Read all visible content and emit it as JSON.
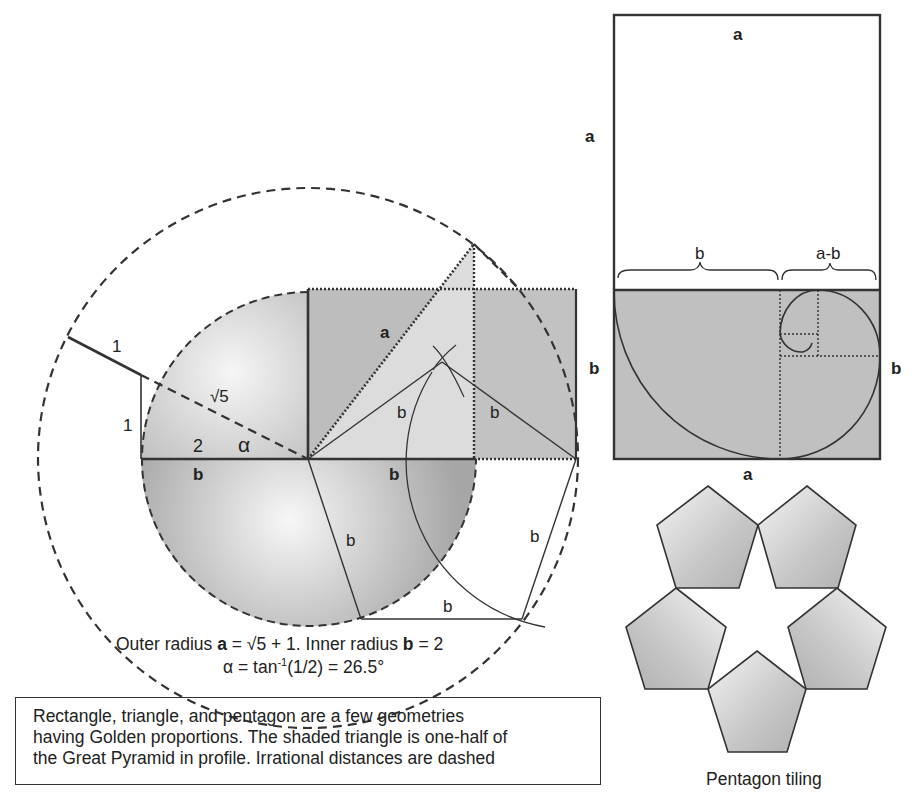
{
  "colors": {
    "line": "#333333",
    "shade_dark": "#a9a9a9",
    "shade_mid": "#c4c4c4",
    "shade_light": "#f2f2f2",
    "background": "#ffffff"
  },
  "circle_figure": {
    "labels": {
      "one_top": "1",
      "one_side": "1",
      "sqrt5": "√5",
      "two": "2",
      "alpha": "α",
      "b_left": "b",
      "b_right": "b",
      "a_diag": "a",
      "b_tri_left": "b",
      "b_tri_right": "b",
      "b_lower_left": "b",
      "b_lower_bottom": "b",
      "b_lower_right": "b",
      "b_rect_side": "b"
    },
    "formula_line1": {
      "prefix": "Outer radius ",
      "a": "a",
      "mid": " = √5 + 1. Inner radius ",
      "b": "b",
      "suffix": " = 2"
    },
    "formula_line2": {
      "prefix": "α = tan",
      "sup": "-1",
      "suffix": "(1/2) = 26.5°"
    }
  },
  "golden_rectangle": {
    "labels": {
      "top_a": "a",
      "left_a": "a",
      "brace_b": "b",
      "brace_a_minus_b": "a-b",
      "left_b": "b",
      "right_b": "b",
      "bottom_a": "a"
    }
  },
  "pentagon_tiling": {
    "label": "Pentagon tiling"
  },
  "caption": {
    "lines": [
      "Rectangle, triangle, and pentagon are a few geometries",
      "having Golden proportions. The shaded triangle is one-half of",
      "the Great Pyramid in profile. Irrational distances are dashed"
    ]
  }
}
